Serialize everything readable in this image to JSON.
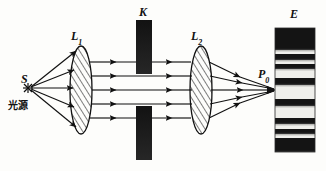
{
  "figure": {
    "kind": "optics-ray-diagram",
    "title_visible": false,
    "background_color": "#fdfdfb",
    "ink_color": "#111111",
    "width": 326,
    "height": 171
  },
  "labels": {
    "source_symbol": "S",
    "source_text_cjk": "光源",
    "lens1_letter": "L",
    "lens1_subscript": "1",
    "aperture_letter": "K",
    "lens2_letter": "L",
    "lens2_subscript": "2",
    "focus_letter": "P",
    "focus_subscript": "0",
    "screen_letter": "E"
  },
  "optics": {
    "source": {
      "x": 28,
      "y": 88,
      "marker": "asterisk"
    },
    "lens1": {
      "cx": 81,
      "cy": 90,
      "rx": 11,
      "ry": 44,
      "hatch": true
    },
    "lens2": {
      "cx": 201,
      "cy": 90,
      "rx": 11,
      "ry": 44,
      "hatch": true
    },
    "aperture_top_block": {
      "x": 136,
      "y": 20,
      "w": 16,
      "h": 54,
      "color": "#1a1a1a"
    },
    "aperture_bottom_block": {
      "x": 136,
      "y": 106,
      "w": 16,
      "h": 54,
      "color": "#1a1a1a"
    },
    "aperture_gap": {
      "y_top": 74,
      "y_bottom": 106
    },
    "screen": {
      "x": 275,
      "y": 28,
      "w": 40,
      "h": 124
    },
    "focal_point": {
      "x": 275,
      "y": 90
    },
    "ray_heights": [
      62,
      76,
      90,
      104,
      118
    ],
    "ray_count": 5,
    "parallel_segment": {
      "x_start": 92,
      "x_end": 190
    }
  },
  "fringes": {
    "orientation": "horizontal",
    "description": "interference fringe pattern on screen E",
    "bands": [
      {
        "offset": 0,
        "height": 22,
        "tone": "dark"
      },
      {
        "offset": 22,
        "height": 4,
        "tone": "light"
      },
      {
        "offset": 26,
        "height": 6,
        "tone": "dark"
      },
      {
        "offset": 32,
        "height": 4,
        "tone": "light"
      },
      {
        "offset": 36,
        "height": 5,
        "tone": "dark"
      },
      {
        "offset": 41,
        "height": 9,
        "tone": "light"
      },
      {
        "offset": 50,
        "height": 7,
        "tone": "dark"
      },
      {
        "offset": 57,
        "height": 14,
        "tone": "light"
      },
      {
        "offset": 71,
        "height": 7,
        "tone": "dark"
      },
      {
        "offset": 78,
        "height": 12,
        "tone": "light"
      },
      {
        "offset": 90,
        "height": 6,
        "tone": "dark"
      },
      {
        "offset": 96,
        "height": 5,
        "tone": "light"
      },
      {
        "offset": 101,
        "height": 5,
        "tone": "dark"
      },
      {
        "offset": 106,
        "height": 4,
        "tone": "light"
      },
      {
        "offset": 110,
        "height": 14,
        "tone": "dark"
      }
    ]
  }
}
